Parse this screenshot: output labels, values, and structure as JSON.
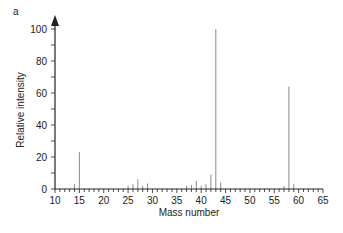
{
  "panel_label": "a",
  "chart_data": {
    "type": "bar",
    "title": "",
    "xlabel": "Mass number",
    "ylabel": "Relative intensity",
    "xlim": [
      10,
      65
    ],
    "ylim": [
      0,
      100
    ],
    "xticks_major": [
      10,
      15,
      20,
      25,
      30,
      35,
      40,
      45,
      50,
      55,
      60,
      65
    ],
    "xticks_minor_step": 1,
    "yticks_major": [
      0,
      20,
      40,
      60,
      80,
      100
    ],
    "yticks_minor_step": 10,
    "grid": false,
    "legend": null,
    "peaks": [
      {
        "x": 14,
        "y": 3
      },
      {
        "x": 15,
        "y": 23
      },
      {
        "x": 25,
        "y": 2
      },
      {
        "x": 26,
        "y": 3
      },
      {
        "x": 27,
        "y": 6
      },
      {
        "x": 28,
        "y": 2
      },
      {
        "x": 29,
        "y": 3.5
      },
      {
        "x": 37,
        "y": 2
      },
      {
        "x": 38,
        "y": 2.5
      },
      {
        "x": 39,
        "y": 5
      },
      {
        "x": 40,
        "y": 2
      },
      {
        "x": 41,
        "y": 3
      },
      {
        "x": 42,
        "y": 9
      },
      {
        "x": 43,
        "y": 100
      },
      {
        "x": 44,
        "y": 4
      },
      {
        "x": 57,
        "y": 2
      },
      {
        "x": 58,
        "y": 64
      },
      {
        "x": 59,
        "y": 3
      }
    ]
  },
  "colors": {
    "axis": "#222222",
    "peak": "#8a8a8a",
    "text": "#222222"
  }
}
